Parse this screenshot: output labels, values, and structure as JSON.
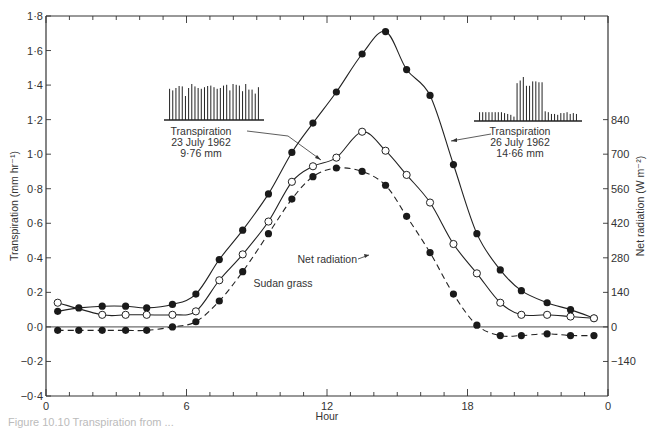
{
  "chart_data": {
    "type": "line",
    "title": "",
    "xlabel": "Hour",
    "ylabel": "Transpiration (mm hr⁻¹)",
    "y2label": "Net radiation (W m⁻²)",
    "xlim": [
      0,
      24
    ],
    "ylim": [
      -0.4,
      1.8
    ],
    "y2lim": [
      -280,
      1260
    ],
    "x_ticks": [
      0,
      6,
      12,
      18,
      24
    ],
    "x_tick_labels": [
      "0",
      "6",
      "12",
      "18",
      "0"
    ],
    "y_ticks": [
      -0.4,
      -0.2,
      0.0,
      0.2,
      0.4,
      0.6,
      0.8,
      1.0,
      1.2,
      1.4,
      1.6,
      1.8
    ],
    "y_tick_labels": [
      "−0·4",
      "−0·2",
      "0·0",
      "0·2",
      "0·4",
      "0·6",
      "0·8",
      "1·0",
      "1·2",
      "1·4",
      "1·6",
      "1·8"
    ],
    "y2_ticks": [
      -140,
      0,
      140,
      280,
      420,
      560,
      700,
      840
    ],
    "y2_tick_labels": [
      "−140",
      "0",
      "140",
      "280",
      "420",
      "560",
      "700",
      "840"
    ],
    "grid": false,
    "series": [
      {
        "name": "Transpiration 26 July 1962 (14·66 mm)",
        "marker": "filled-circle",
        "line": "solid",
        "x": [
          0.5,
          1.4,
          2.4,
          3.4,
          4.3,
          5.4,
          6.4,
          7.4,
          8.4,
          9.5,
          10.5,
          11.4,
          12.4,
          13.5,
          14.5,
          15.4,
          16.4,
          17.4,
          18.4,
          19.4,
          20.3,
          21.4,
          22.4,
          23.4
        ],
        "values": [
          0.09,
          0.11,
          0.12,
          0.12,
          0.11,
          0.13,
          0.19,
          0.39,
          0.56,
          0.77,
          1.01,
          1.18,
          1.36,
          1.58,
          1.71,
          1.49,
          1.34,
          0.94,
          0.54,
          0.33,
          0.21,
          0.14,
          0.1,
          0.05
        ]
      },
      {
        "name": "Transpiration 23 July 1962 (9·76 mm)",
        "marker": "open-circle",
        "line": "solid",
        "x": [
          0.5,
          2.4,
          3.4,
          4.3,
          5.4,
          6.4,
          7.4,
          8.4,
          9.5,
          10.5,
          11.4,
          12.4,
          13.5,
          14.5,
          15.4,
          16.4,
          17.4,
          18.4,
          19.4,
          20.3,
          21.4,
          22.4,
          23.4
        ],
        "values": [
          0.14,
          0.07,
          0.07,
          0.07,
          0.07,
          0.09,
          0.27,
          0.42,
          0.61,
          0.84,
          0.93,
          0.98,
          1.13,
          1.02,
          0.88,
          0.72,
          0.48,
          0.31,
          0.14,
          0.07,
          0.07,
          0.06,
          0.05
        ]
      },
      {
        "name": "Net radiation",
        "marker": "filled-circle",
        "line": "dashed",
        "x": [
          0.5,
          1.4,
          2.4,
          3.4,
          4.3,
          5.4,
          6.4,
          7.4,
          8.4,
          9.5,
          10.5,
          11.4,
          12.4,
          13.5,
          14.5,
          15.4,
          16.4,
          17.4,
          18.4,
          19.4,
          20.3,
          21.4,
          22.4,
          23.4
        ],
        "values": [
          -0.02,
          -0.02,
          -0.02,
          -0.02,
          -0.02,
          0.0,
          0.03,
          0.15,
          0.32,
          0.54,
          0.74,
          0.87,
          0.92,
          0.9,
          0.82,
          0.64,
          0.43,
          0.19,
          0.01,
          -0.05,
          -0.05,
          -0.04,
          -0.05,
          -0.05
        ]
      }
    ],
    "annotations": [
      {
        "lines": [
          "Transpiration",
          "23 July 1962",
          "9·76 mm"
        ],
        "points_to": "open-circle series"
      },
      {
        "lines": [
          "Transpiration",
          "26 July 1962",
          "14·66 mm"
        ],
        "points_to": "filled-circle solid series"
      },
      {
        "text": "Net radiation",
        "points_to": "dashed series"
      },
      {
        "text": "Sudan grass"
      }
    ],
    "insets": [
      {
        "name": "trace-23-july",
        "bars": [
          0.78,
          0.74,
          0.8,
          0.85,
          0.84,
          0.6,
          0.8,
          0.9,
          0.84,
          0.8,
          0.78,
          0.82,
          0.85,
          0.86,
          0.82,
          0.78,
          0.8,
          0.86,
          0.88,
          0.74,
          0.9,
          0.88,
          0.86,
          0.72,
          0.9,
          0.76,
          0.76,
          0.66,
          0.82
        ]
      },
      {
        "name": "trace-26-july",
        "bars": [
          0.2,
          0.2,
          0.2,
          0.2,
          0.2,
          0.2,
          0.2,
          0.2,
          0.18,
          0.16,
          0.14,
          0.1,
          0.86,
          0.92,
          1.0,
          0.8,
          0.8,
          0.9,
          0.9,
          0.88,
          0.88,
          0.22,
          0.2,
          0.16,
          0.16,
          0.14,
          0.18,
          0.18,
          0.2,
          0.16,
          0.18,
          0.16
        ]
      }
    ]
  },
  "labels": {
    "ylabel": "Transpiration (mm hr⁻¹)",
    "y2label": "Net radiation (W m⁻²)",
    "xlabel": "Hour",
    "sudan_grass": "Sudan grass",
    "net_radiation": "Net radiation",
    "t23_line1": "Transpiration",
    "t23_line2": "23  July  1962",
    "t23_line3": "9·76 mm",
    "t26_line1": "Transpiration",
    "t26_line2": "26  July  1962",
    "t26_line3": "14·66 mm",
    "caption": "Figure 10.10  Transpiration from ..."
  }
}
